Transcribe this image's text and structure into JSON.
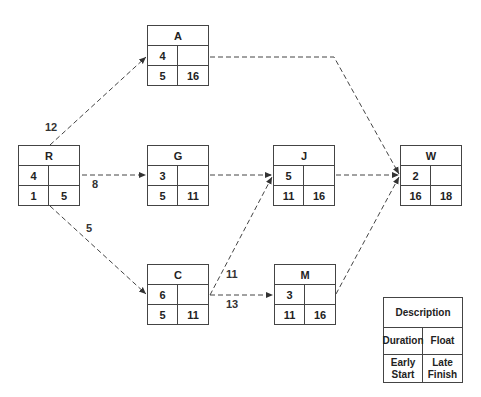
{
  "nodes": {
    "A": {
      "name": "A",
      "duration": "4",
      "float": "",
      "early_start": "5",
      "late_finish": "16"
    },
    "R": {
      "name": "R",
      "duration": "4",
      "float": "",
      "early_start": "1",
      "late_finish": "5"
    },
    "G": {
      "name": "G",
      "duration": "3",
      "float": "",
      "early_start": "5",
      "late_finish": "11"
    },
    "J": {
      "name": "J",
      "duration": "5",
      "float": "",
      "early_start": "11",
      "late_finish": "16"
    },
    "W": {
      "name": "W",
      "duration": "2",
      "float": "",
      "early_start": "16",
      "late_finish": "18"
    },
    "C": {
      "name": "C",
      "duration": "6",
      "float": "",
      "early_start": "5",
      "late_finish": "11"
    },
    "M": {
      "name": "M",
      "duration": "3",
      "float": "",
      "early_start": "11",
      "late_finish": "16"
    }
  },
  "edges": [
    {
      "from": "R",
      "to": "A",
      "label": "12"
    },
    {
      "from": "R",
      "to": "G",
      "label": "8"
    },
    {
      "from": "R",
      "to": "C",
      "label": "5"
    },
    {
      "from": "A",
      "to": "W",
      "label": ""
    },
    {
      "from": "G",
      "to": "J",
      "label": ""
    },
    {
      "from": "C",
      "to": "J",
      "label": "11"
    },
    {
      "from": "C",
      "to": "M",
      "label": "13"
    },
    {
      "from": "J",
      "to": "W",
      "label": ""
    },
    {
      "from": "M",
      "to": "W",
      "label": ""
    }
  ],
  "legend": {
    "title": "Description",
    "duration": "Duration",
    "float": "Float",
    "early_start": "Early Start",
    "late_finish": "Late Finish"
  }
}
